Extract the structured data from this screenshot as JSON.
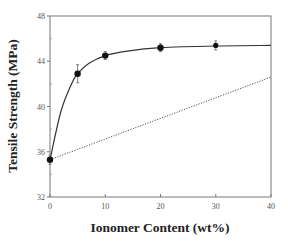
{
  "chart_data": {
    "type": "line",
    "title": "",
    "xlabel": "Ionomer  Content  (wt%)",
    "ylabel": "Tensile  Strength  (MPa)",
    "xlim": [
      0,
      40
    ],
    "ylim": [
      32,
      48
    ],
    "xticks": [
      0,
      10,
      20,
      30,
      40
    ],
    "yticks": [
      32,
      36,
      40,
      44,
      48
    ],
    "grid": false,
    "legend": null,
    "series": [
      {
        "name": "Measured",
        "style": "markers-with-error-bars-and-smooth-fit",
        "x": [
          0,
          5,
          10,
          20,
          30
        ],
        "y": [
          35.3,
          42.9,
          44.5,
          45.2,
          45.4
        ],
        "error": [
          0.4,
          0.8,
          0.35,
          0.35,
          0.4
        ]
      },
      {
        "name": "Fitted curve",
        "style": "solid",
        "x": [
          0,
          2,
          4,
          5,
          7,
          10,
          14,
          20,
          30,
          40
        ],
        "y": [
          35.3,
          39.6,
          42.1,
          42.9,
          43.8,
          44.5,
          44.9,
          45.2,
          45.35,
          45.4
        ]
      },
      {
        "name": "Additivity line",
        "style": "dotted",
        "x": [
          0,
          40
        ],
        "y": [
          35.3,
          42.6
        ]
      }
    ]
  }
}
